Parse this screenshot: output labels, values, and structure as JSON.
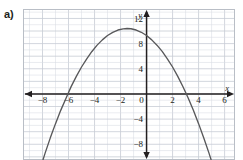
{
  "part_label": "a)",
  "chart_data": {
    "type": "line",
    "title": "",
    "xlabel": "x",
    "ylabel": "y",
    "xlim": [
      -9.5,
      6.8
    ],
    "ylim": [
      -10.5,
      13.5
    ],
    "grid": true,
    "grid_step": 1,
    "legend": null,
    "x_ticks": [
      -8,
      -6,
      -4,
      -2,
      0,
      2,
      4,
      6
    ],
    "x_tick_labels": [
      "−8",
      "−6",
      "−4",
      "−2",
      "0",
      "2",
      "4",
      "6"
    ],
    "y_ticks": [
      12,
      8,
      4,
      -4,
      -8
    ],
    "y_tick_labels": [
      "12",
      "8",
      "4",
      "−4",
      "−8"
    ],
    "curve": {
      "name": "parabola",
      "equation": "y = -0.5(x + 1.5)^2 + 10.4",
      "vertex": [
        -1.5,
        10.4
      ],
      "x_intercepts": [
        -6.06,
        3.06
      ],
      "y_intercept": 9.27,
      "direction": "opens-down",
      "color": "#58585a",
      "x": [
        -8.2,
        -7.8,
        -7.4,
        -7.0,
        -6.6,
        -6.2,
        -5.8,
        -5.4,
        -5.0,
        -4.6,
        -4.2,
        -3.8,
        -3.4,
        -3.0,
        -2.6,
        -2.2,
        -1.8,
        -1.5,
        -1.2,
        -0.8,
        -0.4,
        0.0,
        0.4,
        0.8,
        1.2,
        1.6,
        2.0,
        2.4,
        2.8,
        3.2,
        3.6,
        4.0,
        4.4,
        4.8,
        5.2
      ],
      "y": [
        -12.05,
        -9.41,
        -6.98,
        -4.72,
        -2.61,
        -0.71,
        1.16,
        2.79,
        4.28,
        5.59,
        6.75,
        7.76,
        8.59,
        9.28,
        9.79,
        10.16,
        10.35,
        10.4,
        10.36,
        10.16,
        9.8,
        9.28,
        8.59,
        7.75,
        6.76,
        5.59,
        4.28,
        2.79,
        1.15,
        -0.65,
        -2.6,
        -4.72,
        -6.99,
        -9.41,
        -12.0
      ]
    },
    "colors": {
      "curve": "#58585a",
      "axis": "#231f20",
      "grid": "#d9dde3",
      "grid_major": "#c6ccd4",
      "background": "#ffffff",
      "border": "#b9bec6"
    }
  }
}
